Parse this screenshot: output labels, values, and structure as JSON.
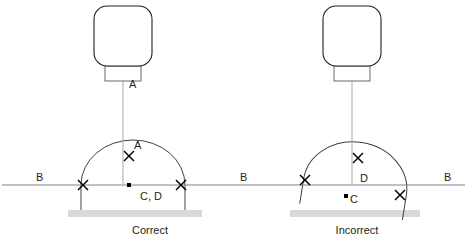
{
  "diagram": {
    "colors": {
      "outline": "#231f20",
      "arc": "#414042",
      "baseline": "#808285",
      "plumb": "#a7a9ac",
      "ground": "#d9d9d9",
      "mark": "#000000"
    },
    "panels": [
      {
        "id": "correct",
        "caption": "Correct",
        "caption_x": 150,
        "caption_y": 234,
        "device": {
          "body_x": 94,
          "body_y": 6,
          "body_w": 58,
          "body_h": 60,
          "body_r": 13,
          "neck_x": 105,
          "neck_y": 66,
          "neck_w": 36,
          "neck_h": 15,
          "plumb_x": 123,
          "plumb_y1": 81,
          "plumb_y2": 185
        },
        "ground": {
          "x": 68,
          "y": 210,
          "w": 134,
          "h": 7
        },
        "arc": {
          "cx": 133,
          "cy": 185,
          "rx": 52,
          "ry": 45,
          "rotation": 0,
          "leg_drop": 25
        },
        "marks": [
          {
            "name": "apex",
            "x": 129,
            "y": 156,
            "size": 5
          },
          {
            "name": "left-intersection",
            "x": 83,
            "y": 185,
            "size": 5
          },
          {
            "name": "right-intersection",
            "x": 181,
            "y": 185,
            "size": 5
          }
        ],
        "dot": {
          "x": 127,
          "y": 185,
          "w": 4,
          "h": 4
        },
        "labels": [
          {
            "name": "label-a-upper",
            "text": "A",
            "x": 129,
            "y": 88
          },
          {
            "name": "label-a-apex",
            "text": "A",
            "x": 134,
            "y": 149
          },
          {
            "name": "label-cd",
            "text": "C, D",
            "x": 140,
            "y": 200
          }
        ]
      },
      {
        "id": "incorrect",
        "caption": "Incorrect",
        "caption_x": 357,
        "caption_y": 234,
        "device": {
          "body_x": 323,
          "body_y": 6,
          "body_w": 58,
          "body_h": 60,
          "body_r": 13,
          "neck_x": 334,
          "neck_y": 66,
          "neck_w": 36,
          "neck_h": 15,
          "plumb_x": 352,
          "plumb_y1": 81,
          "plumb_y2": 185
        },
        "ground": {
          "x": 290,
          "y": 210,
          "w": 130,
          "h": 7
        },
        "arc": {
          "cx": 355,
          "cy": 187,
          "rx": 52,
          "ry": 45,
          "rotation": 9,
          "leg_drop": 25
        },
        "marks": [
          {
            "name": "apex",
            "x": 358,
            "y": 158,
            "size": 5
          },
          {
            "name": "left-intersection",
            "x": 305,
            "y": 180,
            "size": 5
          },
          {
            "name": "right-intersection",
            "x": 400,
            "y": 195,
            "size": 5
          }
        ],
        "dot": {
          "x": 344,
          "y": 196,
          "w": 4,
          "h": 4
        },
        "labels": [
          {
            "name": "label-d",
            "text": "D",
            "x": 360,
            "y": 182
          },
          {
            "name": "label-c",
            "text": "C",
            "x": 350,
            "y": 203
          }
        ]
      }
    ],
    "baseline": {
      "x1": 2,
      "x2": 465,
      "y": 185
    },
    "baseline_labels": [
      {
        "name": "label-b-left",
        "text": "B",
        "x": 36,
        "y": 181
      },
      {
        "name": "label-b-middle",
        "text": "B",
        "x": 240,
        "y": 181
      },
      {
        "name": "label-b-right",
        "text": "B",
        "x": 444,
        "y": 181
      }
    ]
  }
}
